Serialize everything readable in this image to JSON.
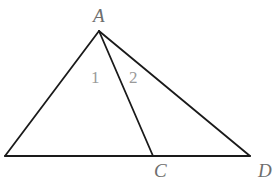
{
  "figure": {
    "type": "geometry-triangle",
    "line_color": "#1a1a1a",
    "label_color": "#6e6e6e",
    "points": {
      "A": {
        "x": 99,
        "y": 31
      },
      "B": {
        "x": 5,
        "y": 156
      },
      "C": {
        "x": 153,
        "y": 156
      },
      "D": {
        "x": 250,
        "y": 156
      }
    },
    "segments": [
      [
        "B",
        "A"
      ],
      [
        "A",
        "C"
      ],
      [
        "A",
        "D"
      ],
      [
        "B",
        "D"
      ]
    ],
    "vertex_labels": {
      "A": "A",
      "C": "C",
      "D": "D"
    },
    "angle_labels": {
      "angle1": "1",
      "angle2": "2"
    }
  }
}
